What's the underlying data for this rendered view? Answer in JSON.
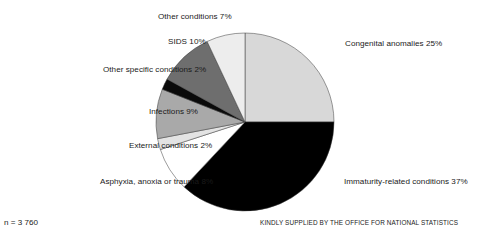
{
  "chart_data": {
    "type": "pie",
    "title": "",
    "subtitle": "",
    "xlabel": "",
    "ylabel": "",
    "legend_position": "none",
    "grid": false,
    "unit": "%",
    "start_angle_deg": 0,
    "direction": "clockwise",
    "categories": [
      "Congenital anomalies",
      "Immaturity-related conditions",
      "Asphyxia, anoxia or trauma",
      "External conditions",
      "Infections",
      "Other specific conditions",
      "SIDS",
      "Other conditions"
    ],
    "values": [
      25,
      37,
      8,
      2,
      9,
      2,
      10,
      7
    ],
    "slices": [
      {
        "label": "Congenital anomalies",
        "value": 25,
        "text": "Congenital anomalies 25%",
        "color": "#d8d8d8",
        "start_deg": 0,
        "end_deg": 90
      },
      {
        "label": "Immaturity-related conditions",
        "value": 37,
        "text": "Immaturity-related conditions 37%",
        "color": "#000000",
        "start_deg": 90,
        "end_deg": 223.2
      },
      {
        "label": "Asphyxia, anoxia or trauma",
        "value": 8,
        "text": "Asphyxia, anoxia or trauma 8%",
        "color": "#ffffff",
        "start_deg": 223.2,
        "end_deg": 252
      },
      {
        "label": "External conditions",
        "value": 2,
        "text": "External conditions 2%",
        "color": "#e3e3e3",
        "start_deg": 252,
        "end_deg": 259.2
      },
      {
        "label": "Infections",
        "value": 9,
        "text": "Infections 9%",
        "color": "#a9a9a9",
        "start_deg": 259.2,
        "end_deg": 291.6
      },
      {
        "label": "Other specific conditions",
        "value": 2,
        "text": "Other specific conditions 2%",
        "color": "#0a0a0a",
        "start_deg": 291.6,
        "end_deg": 298.8
      },
      {
        "label": "SIDS",
        "value": 10,
        "text": "SIDS 10%",
        "color": "#6e6e6e",
        "start_deg": 298.8,
        "end_deg": 334.8
      },
      {
        "label": "Other conditions",
        "value": 7,
        "text": "Other conditions 7%",
        "color": "#ededed",
        "start_deg": 334.8,
        "end_deg": 360
      }
    ],
    "annotations": {
      "sample_size": "n = 3 760",
      "credit": "KINDLY SUPPLIED BY THE OFFICE FOR NATIONAL STATISTICS"
    }
  },
  "labels": {
    "other_conditions": "Other conditions 7%",
    "sids": "SIDS 10%",
    "other_specific_conditions": "Other specific conditions 2%",
    "infections": "Infections 9%",
    "external_conditions": "External conditions 2%",
    "asphyxia": "Asphyxia, anoxia or trauma 8%",
    "congenital_anomalies": "Congenital anomalies 25%",
    "immaturity_related": "Immaturity-related conditions 37%"
  },
  "footer": {
    "sample_size": "n = 3 760",
    "credit": "KINDLY SUPPLIED BY THE OFFICE FOR NATIONAL STATISTICS"
  },
  "colors": {
    "background": "#ffffff",
    "text": "#1a1a1a",
    "slice_outline": "#3a3a3a"
  }
}
